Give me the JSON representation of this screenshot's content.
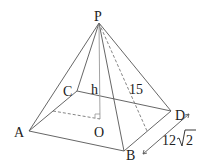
{
  "figure": {
    "type": "square pyramid",
    "labels": {
      "apex": "P",
      "a": "A",
      "b": "B",
      "c": "C",
      "d": "D",
      "center": "O",
      "height": "h",
      "slant": "15",
      "side_coef": "12",
      "side_rad": "2"
    },
    "points": {
      "P": [
        99,
        23
      ],
      "A": [
        29,
        131
      ],
      "B": [
        124,
        151
      ],
      "C": [
        77,
        91
      ],
      "D": [
        171,
        111
      ],
      "O": [
        100,
        119
      ],
      "M": [
        147,
        131
      ],
      "N": [
        53,
        111
      ]
    }
  }
}
